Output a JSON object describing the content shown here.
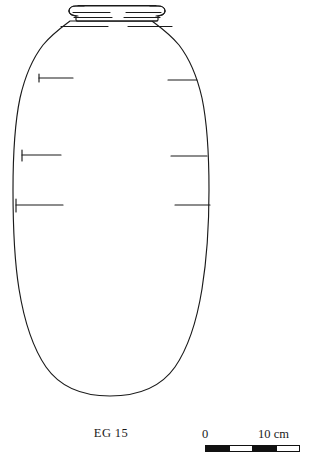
{
  "figure": {
    "type": "archaeological-vessel-profile-drawing",
    "caption": "EG 15",
    "object_name": "EG 15"
  },
  "scale": {
    "zero_label": "0",
    "max_label": "10 cm",
    "units": "cm",
    "min_value": 0,
    "max_value": 10,
    "segment_count": 4,
    "segment_value": 2.5,
    "segments": [
      "fill",
      "blank",
      "fill",
      "blank"
    ]
  },
  "style": {
    "line_color": "#1a1a1a",
    "fill_color": "#ffffff",
    "background": "#ffffff",
    "line_width": 1.15
  },
  "drawing": {
    "rim": {
      "name": "everted-rolled-rim",
      "top_y": 4,
      "bottom_y": 21,
      "left_x": 68,
      "right_x": 166
    },
    "body": {
      "name": "ovoid-body",
      "max_width_y": 232,
      "left_x": 14,
      "right_x": 209,
      "base_y": 396
    },
    "tick_marks_left": [
      {
        "y": 78,
        "x_start": 38,
        "x_end": 72
      },
      {
        "y": 155,
        "x_start": 22,
        "x_end": 60
      },
      {
        "y": 205,
        "x_start": 16,
        "x_end": 62
      }
    ],
    "tick_marks_right": [
      {
        "y": 80,
        "x_start": 168,
        "x_end": 196
      },
      {
        "y": 156,
        "x_start": 172,
        "x_end": 208
      },
      {
        "y": 205,
        "x_start": 176,
        "x_end": 210
      }
    ]
  }
}
